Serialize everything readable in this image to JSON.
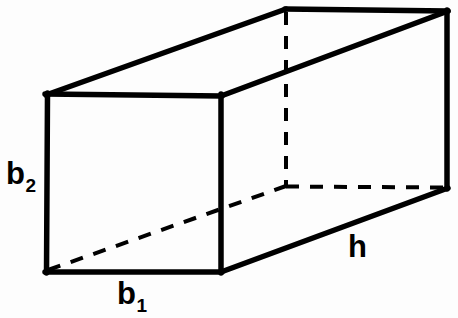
{
  "figure": {
    "name": "rectangular-prism-diagram",
    "background_color": "#fdfdfd",
    "line_color": "#000000",
    "solid_stroke_width": 5,
    "dashed_stroke_width": 4,
    "dash_pattern": "13 11"
  },
  "labels": {
    "height_left": {
      "base": "b",
      "sub": "2",
      "full": "b2"
    },
    "width_bottom": {
      "base": "b",
      "sub": "1",
      "full": "b1"
    },
    "depth_right": {
      "base": "h",
      "sub": "",
      "full": "h"
    }
  },
  "geometry": {
    "front_face": [
      [
        47,
        94
      ],
      [
        221,
        96
      ],
      [
        221,
        272
      ],
      [
        46,
        272
      ]
    ],
    "back_face": [
      [
        286,
        9
      ],
      [
        447,
        11
      ],
      [
        447,
        188
      ],
      [
        286,
        186
      ]
    ],
    "solid_edges": [
      [
        [
          47,
          94
        ],
        [
          221,
          96
        ]
      ],
      [
        [
          221,
          96
        ],
        [
          221,
          272
        ]
      ],
      [
        [
          221,
          272
        ],
        [
          46,
          272
        ]
      ],
      [
        [
          46,
          272
        ],
        [
          47,
          94
        ]
      ],
      [
        [
          47,
          94
        ],
        [
          286,
          9
        ]
      ],
      [
        [
          286,
          9
        ],
        [
          447,
          11
        ]
      ],
      [
        [
          221,
          96
        ],
        [
          447,
          11
        ]
      ],
      [
        [
          447,
          11
        ],
        [
          447,
          188
        ]
      ],
      [
        [
          221,
          272
        ],
        [
          447,
          188
        ]
      ]
    ],
    "dashed_edges": [
      [
        [
          286,
          12
        ],
        [
          286,
          186
        ]
      ],
      [
        [
          286,
          186
        ],
        [
          447,
          187
        ]
      ],
      [
        [
          48,
          270
        ],
        [
          286,
          186
        ]
      ]
    ]
  }
}
